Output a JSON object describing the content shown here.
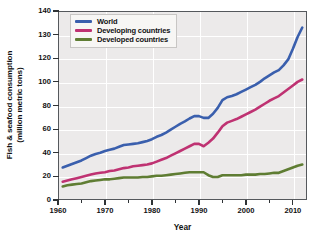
{
  "chart_data": {
    "type": "line",
    "title": "",
    "xlabel": "Year",
    "ylabel": "Fish & seafood consumption (million metric tons)",
    "ylabel_line1": "Fish & seafood consumption",
    "ylabel_line2": "(million metric tons)",
    "xlim": [
      1960,
      2013
    ],
    "ylim": [
      0,
      140
    ],
    "grid": true,
    "legend_position": "top-left",
    "ytick_labels": [
      "140",
      "130",
      "120",
      "100",
      "80",
      "60",
      "40",
      "20",
      "0"
    ],
    "ytick_values": [
      140,
      130,
      120,
      100,
      80,
      60,
      40,
      20,
      0
    ],
    "xtick_labels": [
      "1960",
      "1970",
      "1980",
      "1990",
      "2000",
      "2010"
    ],
    "xtick_values": [
      1960,
      1970,
      1980,
      1990,
      2000,
      2010
    ],
    "xtick_minor_values": [
      1965,
      1975,
      1985,
      1995,
      2005
    ],
    "x": [
      1961,
      1962,
      1963,
      1964,
      1965,
      1966,
      1967,
      1968,
      1969,
      1970,
      1971,
      1972,
      1973,
      1974,
      1975,
      1976,
      1977,
      1978,
      1979,
      1980,
      1981,
      1982,
      1983,
      1984,
      1985,
      1986,
      1987,
      1988,
      1989,
      1990,
      1991,
      1992,
      1993,
      1994,
      1995,
      1996,
      1997,
      1998,
      1999,
      2000,
      2001,
      2002,
      2003,
      2004,
      2005,
      2006,
      2007,
      2008,
      2009,
      2010,
      2011,
      2012
    ],
    "series": [
      {
        "name": "World",
        "color": "#3a5fad",
        "values": [
          27.5,
          29.0,
          30.5,
          32.0,
          33.5,
          35.5,
          37.5,
          39.0,
          40.0,
          41.5,
          42.5,
          43.5,
          45.0,
          46.5,
          47.0,
          47.5,
          48.0,
          49.0,
          50.0,
          51.5,
          53.5,
          55.0,
          57.0,
          59.5,
          62.0,
          64.5,
          66.5,
          69.0,
          71.0,
          71.0,
          69.5,
          69.5,
          73.0,
          78.0,
          84.5,
          87.0,
          88.0,
          89.5,
          91.5,
          93.5,
          95.5,
          97.5,
          100.0,
          103.0,
          105.5,
          108.0,
          110.0,
          114.0,
          119.0,
          124.0,
          129.0,
          133.0
        ]
      },
      {
        "name": "Developing countries",
        "color": "#bf3272",
        "values": [
          15.5,
          16.5,
          17.5,
          18.5,
          19.5,
          20.5,
          21.5,
          22.5,
          23.0,
          23.5,
          24.5,
          25.0,
          26.0,
          27.0,
          27.5,
          28.5,
          29.0,
          29.5,
          30.0,
          31.0,
          32.5,
          34.0,
          35.5,
          37.5,
          39.5,
          41.5,
          43.5,
          45.5,
          47.5,
          47.5,
          45.5,
          48.5,
          52.0,
          57.0,
          62.5,
          65.5,
          67.0,
          68.5,
          70.5,
          72.5,
          74.5,
          76.5,
          79.0,
          81.5,
          84.0,
          86.0,
          88.0,
          91.0,
          94.0,
          97.0,
          100.0,
          102.0
        ]
      },
      {
        "name": "Developed countries",
        "color": "#5f7d33",
        "values": [
          11.5,
          12.5,
          13.0,
          13.5,
          14.0,
          15.0,
          16.0,
          16.5,
          17.0,
          17.5,
          17.5,
          18.0,
          18.5,
          19.0,
          19.0,
          19.0,
          19.0,
          19.5,
          19.5,
          20.0,
          20.5,
          20.5,
          21.0,
          21.5,
          22.0,
          22.5,
          23.0,
          23.5,
          23.5,
          23.5,
          23.5,
          21.0,
          19.5,
          19.5,
          21.0,
          21.0,
          21.0,
          21.0,
          21.0,
          21.5,
          21.5,
          21.5,
          22.0,
          22.0,
          22.5,
          23.0,
          23.0,
          24.5,
          26.0,
          27.5,
          29.0,
          30.0
        ]
      }
    ]
  },
  "legend": {
    "items": [
      {
        "label": "World",
        "color": "#3a5fad"
      },
      {
        "label": "Developing countries",
        "color": "#bf3272"
      },
      {
        "label": "Developed countries",
        "color": "#5f7d33"
      }
    ]
  }
}
